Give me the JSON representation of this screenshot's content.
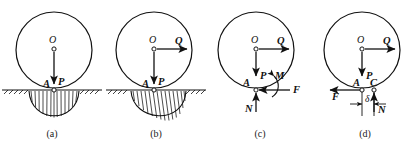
{
  "figure": {
    "stroke_color": "#111111",
    "background_color": "#ffffff"
  },
  "panels": [
    {
      "id": "a",
      "caption": "(a)",
      "has_ground": true,
      "has_pressure_distribution": true,
      "pressure_symmetry": "symmetric",
      "labels": {
        "center": "O",
        "contact": "A",
        "weight": "P"
      },
      "forces": [
        {
          "name": "P",
          "label": "P",
          "direction": "down"
        }
      ]
    },
    {
      "id": "b",
      "caption": "(b)",
      "has_ground": true,
      "has_pressure_distribution": true,
      "pressure_symmetry": "asymmetric-right",
      "labels": {
        "center": "O",
        "contact": "A",
        "weight": "P",
        "applied": "Q"
      },
      "forces": [
        {
          "name": "P",
          "label": "P",
          "direction": "down"
        },
        {
          "name": "Q",
          "label": "Q",
          "direction": "right"
        }
      ]
    },
    {
      "id": "c",
      "caption": "(c)",
      "has_ground": false,
      "has_pressure_distribution": false,
      "labels": {
        "center": "O",
        "contact": "A",
        "weight": "P",
        "applied": "Q",
        "moment": "M",
        "friction": "F",
        "normal": "N"
      },
      "forces": [
        {
          "name": "P",
          "label": "P",
          "direction": "down"
        },
        {
          "name": "Q",
          "label": "Q",
          "direction": "right"
        },
        {
          "name": "M",
          "label": "M",
          "direction": "moment-ccw"
        },
        {
          "name": "F",
          "label": "F",
          "direction": "left"
        },
        {
          "name": "N",
          "label": "N",
          "direction": "up"
        }
      ]
    },
    {
      "id": "d",
      "caption": "(d)",
      "has_ground": false,
      "has_pressure_distribution": false,
      "labels": {
        "center": "O",
        "contact": "A",
        "offset_point": "C",
        "weight": "P",
        "applied": "Q",
        "friction": "F",
        "normal": "N",
        "offset": "δ"
      },
      "forces": [
        {
          "name": "P",
          "label": "P",
          "direction": "down"
        },
        {
          "name": "Q",
          "label": "Q",
          "direction": "right"
        },
        {
          "name": "F",
          "label": "F",
          "direction": "left"
        },
        {
          "name": "N",
          "label": "N",
          "direction": "up"
        }
      ],
      "dimension": {
        "label": "δ",
        "from": "A",
        "to": "C"
      }
    }
  ]
}
